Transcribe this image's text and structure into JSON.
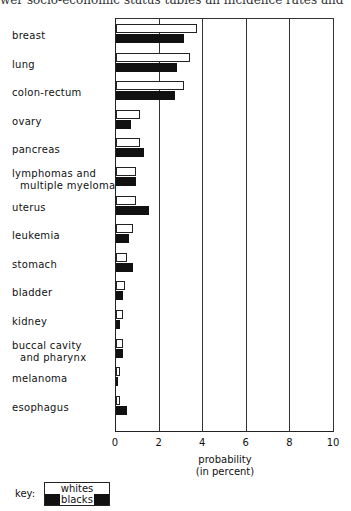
{
  "header_fragment": "wer socio-economic status tables an incidence rates and",
  "chart_data": {
    "type": "bar",
    "orientation": "horizontal",
    "title": "",
    "xlabel": "probability (in percent)",
    "ylabel": "",
    "xlim": [
      0,
      10
    ],
    "xticks": [
      "0",
      "2",
      "4",
      "6",
      "8",
      "10"
    ],
    "grid": true,
    "categories": [
      "breast",
      "lung",
      "colon-rectum",
      "ovary",
      "pancreas",
      "lymphomas and multiple myeloma",
      "uterus",
      "leukemia",
      "stomach",
      "bladder",
      "kidney",
      "buccal cavity and pharynx",
      "melanoma",
      "esophagus"
    ],
    "series": [
      {
        "name": "whites",
        "color": "#ffffff",
        "values": [
          3.7,
          3.4,
          3.1,
          1.1,
          1.1,
          0.9,
          0.9,
          0.8,
          0.5,
          0.4,
          0.3,
          0.3,
          0.2,
          0.2
        ]
      },
      {
        "name": "blacks",
        "color": "#111111",
        "values": [
          3.1,
          2.8,
          2.7,
          0.7,
          1.3,
          0.9,
          1.5,
          0.6,
          0.8,
          0.3,
          0.2,
          0.3,
          0.1,
          0.5
        ]
      }
    ],
    "legend": {
      "title": "key:",
      "position": "bottom-left",
      "entries": [
        "whites",
        "blacks"
      ]
    }
  },
  "labels": [
    {
      "l1": "breast",
      "l2": ""
    },
    {
      "l1": "lung",
      "l2": ""
    },
    {
      "l1": "colon-rectum",
      "l2": ""
    },
    {
      "l1": "ovary",
      "l2": ""
    },
    {
      "l1": "pancreas",
      "l2": ""
    },
    {
      "l1": "lymphomas and",
      "l2": "multiple myeloma"
    },
    {
      "l1": "uterus",
      "l2": ""
    },
    {
      "l1": "leukemia",
      "l2": ""
    },
    {
      "l1": "stomach",
      "l2": ""
    },
    {
      "l1": "bladder",
      "l2": ""
    },
    {
      "l1": "kidney",
      "l2": ""
    },
    {
      "l1": "buccal cavity",
      "l2": "and pharynx"
    },
    {
      "l1": "melanoma",
      "l2": ""
    },
    {
      "l1": "esophagus",
      "l2": ""
    }
  ],
  "axis": {
    "label_line1": "probability",
    "label_line2": "(in percent)"
  },
  "key": {
    "label": "key:",
    "whites": "whites",
    "blacks": "blacks"
  }
}
